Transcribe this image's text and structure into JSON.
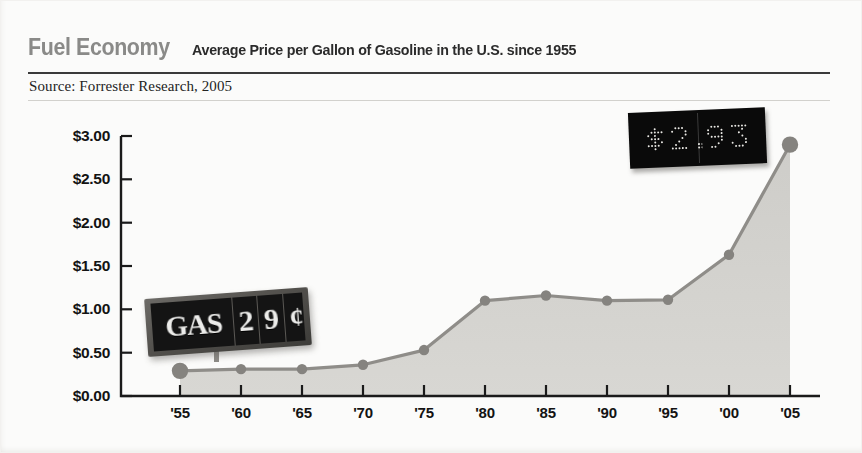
{
  "header": {
    "title": "Fuel Economy",
    "subtitle": "Average Price per Gallon of Gasoline in the U.S. since 1955",
    "source": "Source: Forrester Research, 2005"
  },
  "signs": {
    "vintage": {
      "name": "gas-station-price-sign",
      "label": "GAS 29¢",
      "cells": [
        "GAS",
        "2",
        "9",
        "¢"
      ]
    },
    "led": {
      "name": "led-price-display",
      "label": "$2.93",
      "digits": [
        "$",
        "2",
        ".",
        "9",
        "3"
      ]
    }
  },
  "colors": {
    "title": "#8a8a88",
    "subtitle": "#2b2b2b",
    "axis": "#1a1a1a",
    "line": "#8f8d89",
    "marker": "#85837f",
    "area_fill": "#d2d1cd",
    "page_bg": "#fbfbfa",
    "led_bg": "#0a0a0a",
    "led_dot": "#e8e7e3"
  },
  "chart_data": {
    "type": "line",
    "title": "Fuel Economy",
    "subtitle": "Average Price per Gallon of Gasoline in the U.S. since 1955",
    "source": "Source: Forrester Research, 2005",
    "xlabel": "",
    "ylabel": "",
    "categories": [
      "'55",
      "'60",
      "'65",
      "'70",
      "'75",
      "'80",
      "'85",
      "'90",
      "'95",
      "'00",
      "'05"
    ],
    "values": [
      0.29,
      0.31,
      0.31,
      0.36,
      0.53,
      1.1,
      1.16,
      1.1,
      1.11,
      1.63,
      2.9
    ],
    "ylim": [
      0,
      3.0
    ],
    "ytick_values": [
      0.0,
      0.5,
      1.0,
      1.5,
      2.0,
      2.5,
      3.0
    ],
    "ytick_labels": [
      "$0.00",
      "$0.50",
      "$1.00",
      "$1.50",
      "$2.00",
      "$2.50",
      "$3.00"
    ],
    "grid": false,
    "legend": "none",
    "area": true,
    "annotations": [
      {
        "text": "GAS 29¢",
        "kind": "vintage-sign",
        "near_point": "'55"
      },
      {
        "text": "$2.93",
        "kind": "led-sign",
        "near_point": "'05"
      }
    ]
  }
}
